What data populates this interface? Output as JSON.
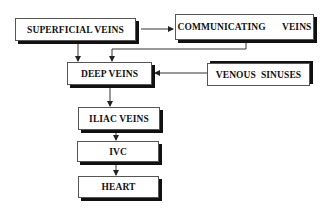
{
  "diagram": {
    "nodes": [
      {
        "id": "superficial",
        "label": "SUPERFICIAL VEINS"
      },
      {
        "id": "communicating",
        "label": "COMMUNICATING   VEINS"
      },
      {
        "id": "deep",
        "label": "DEEP VEINS"
      },
      {
        "id": "sinuses",
        "label": "VENOUS  SINUSES"
      },
      {
        "id": "iliac",
        "label": "ILIAC VEINS"
      },
      {
        "id": "ivc",
        "label": "IVC"
      },
      {
        "id": "heart",
        "label": "HEART"
      }
    ],
    "edges": [
      {
        "from": "superficial",
        "to": "communicating"
      },
      {
        "from": "superficial",
        "to": "deep"
      },
      {
        "from": "communicating",
        "to": "deep"
      },
      {
        "from": "sinuses",
        "to": "deep"
      },
      {
        "from": "deep",
        "to": "iliac"
      },
      {
        "from": "iliac",
        "to": "ivc"
      },
      {
        "from": "ivc",
        "to": "heart"
      }
    ],
    "colors": {
      "box_border": "#555555",
      "shadow": "#111111",
      "line": "#333333"
    }
  }
}
